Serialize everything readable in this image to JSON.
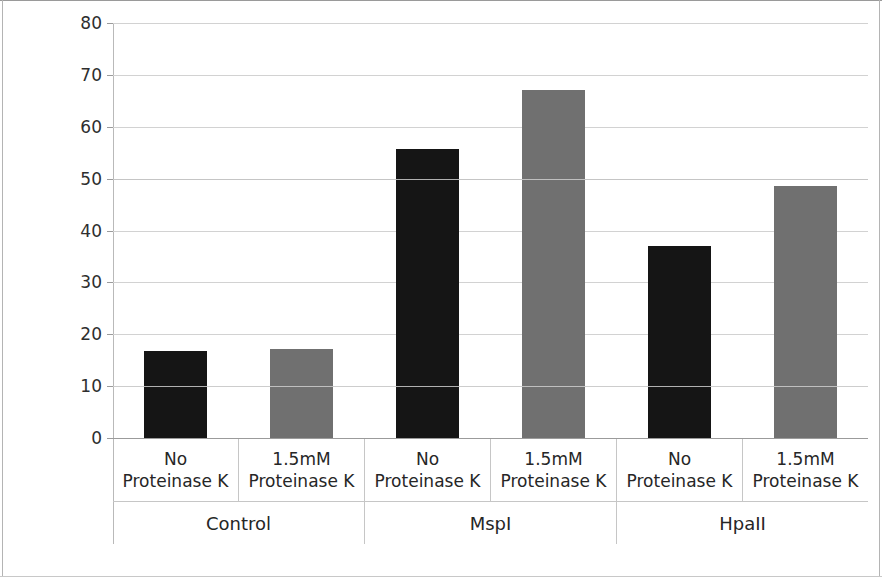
{
  "chart_data": {
    "type": "bar",
    "title": "",
    "xlabel": "",
    "ylabel": "Percentage DNA Methylation",
    "ylim": [
      0,
      80
    ],
    "yticks": [
      0,
      10,
      20,
      30,
      40,
      50,
      60,
      70,
      80
    ],
    "ytick_labels": [
      "0",
      "10",
      "20",
      "30",
      "40",
      "50",
      "60",
      "70",
      "80"
    ],
    "grid": true,
    "legend": "none",
    "categories": [
      "No Proteinase K",
      "1.5mM Proteinase K",
      "No Proteinase K",
      "1.5mM Proteinase K",
      "No Proteinase K",
      "1.5mM Proteinase K"
    ],
    "values": [
      16.8,
      17.1,
      55.8,
      67.0,
      37.0,
      48.6
    ],
    "bar_colors": [
      "#151515",
      "#707070",
      "#151515",
      "#707070",
      "#151515",
      "#707070"
    ],
    "groups": [
      {
        "label": "Control",
        "span": 2
      },
      {
        "label": "MspI",
        "span": 2
      },
      {
        "label": "HpaII",
        "span": 2
      }
    ]
  },
  "axis": {
    "y_title": "Percentage DNA Methylation"
  },
  "colors": {
    "bar_dark": "#151515",
    "bar_light": "#707070",
    "gridline": "#d2d2d2",
    "gridline_strong": "#9b9b9b",
    "text": "#262626",
    "background": "#ffffff"
  }
}
